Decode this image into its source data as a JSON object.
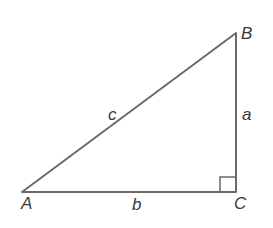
{
  "diagram": {
    "type": "right-triangle",
    "colors": {
      "stroke": "#6a6a6a",
      "text": "#3a3a3a",
      "background": "#ffffff"
    },
    "vertices": [
      {
        "id": "A",
        "label": "A",
        "x": 22,
        "y": 192
      },
      {
        "id": "B",
        "label": "B",
        "x": 236,
        "y": 33
      },
      {
        "id": "C",
        "label": "C",
        "x": 236,
        "y": 192
      }
    ],
    "sides": [
      {
        "id": "a",
        "label": "a",
        "from": "B",
        "to": "C"
      },
      {
        "id": "b",
        "label": "b",
        "from": "A",
        "to": "C"
      },
      {
        "id": "c",
        "label": "c",
        "from": "A",
        "to": "B"
      }
    ],
    "right_angle_at": "C"
  }
}
